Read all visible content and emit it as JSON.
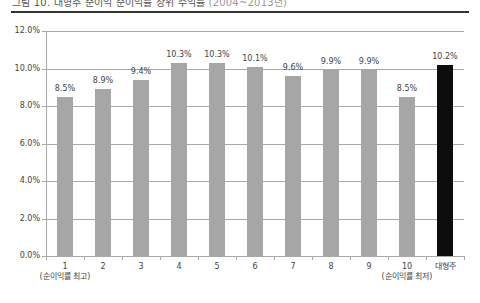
{
  "title": {
    "main": "그림 10. 대형주 순이익 순이익률 상위 수익률",
    "sub": "(2004~2013년)"
  },
  "colors": {
    "bar_default": "#a6a6a6",
    "bar_highlight": "#0d0d0d",
    "grid": "#a9a9a9",
    "rule": "#333333"
  },
  "chart_data": {
    "type": "bar",
    "title": "그림 10. 대형주 순이익 순이익률 상위 수익률",
    "xlabel": "",
    "ylabel": "",
    "categories": [
      "1",
      "2",
      "3",
      "4",
      "5",
      "6",
      "7",
      "8",
      "9",
      "10",
      "대형주"
    ],
    "category_sublabels": [
      "(순이익률 최고)",
      "",
      "",
      "",
      "",
      "",
      "",
      "",
      "",
      "(순이익률 최저)",
      ""
    ],
    "values": [
      8.5,
      8.9,
      9.4,
      10.3,
      10.3,
      10.1,
      9.6,
      9.9,
      9.9,
      8.5,
      10.2
    ],
    "value_labels": [
      "8.5%",
      "8.9%",
      "9.4%",
      "10.3%",
      "10.3%",
      "10.1%",
      "9.6%",
      "9.9%",
      "9.9%",
      "8.5%",
      "10.2%"
    ],
    "highlight_index": 10,
    "ylim": [
      0,
      12
    ],
    "yticks": [
      "0.0%",
      "2.0%",
      "4.0%",
      "6.0%",
      "8.0%",
      "10.0%",
      "12.0%"
    ],
    "grid": true,
    "legend": null
  }
}
